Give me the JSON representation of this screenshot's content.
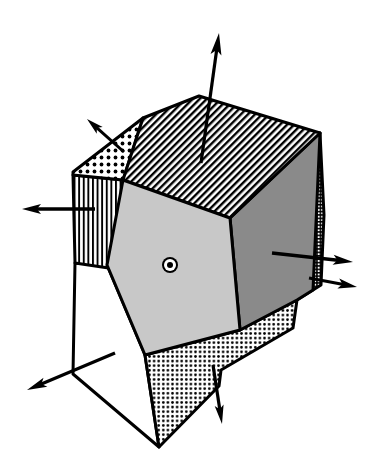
{
  "figure": {
    "type": "line-diagram",
    "background_color": "#ffffff",
    "line_color": "#000000",
    "canvas": {
      "width": 374,
      "height": 476
    }
  },
  "faces": [
    {
      "id": "top-hatched",
      "name": "top-face",
      "fill_style": "diagonal-hatch",
      "fill_color": "#ffffff",
      "pattern_color": "#000000",
      "points": "143,118 199,96 320,133 230,218 123,180"
    },
    {
      "id": "upper-left-dotted",
      "name": "upper-left-facet",
      "fill_style": "coarse-dot-grid",
      "fill_color": "#ffffff",
      "pattern_color": "#000000",
      "points": "143,118 123,180 73,175 73,172"
    },
    {
      "id": "left-striped",
      "name": "left-face",
      "fill_style": "vertical-stripes",
      "fill_color": "#ffffff",
      "pattern_color": "#000000",
      "points": "73,175 123,180 122,270 75,263"
    },
    {
      "id": "center-pentagon",
      "name": "front-face",
      "fill_style": "solid-light-gray",
      "fill_color": "#c8c8c8",
      "pattern_color": "#c8c8c8",
      "points": "123,180 230,218 240,330 145,355 107,265"
    },
    {
      "id": "right-dark",
      "name": "right-face",
      "fill_style": "solid-mid-gray",
      "fill_color": "#8a8a8a",
      "pattern_color": "#8a8a8a",
      "points": "230,218 320,133 313,290 297,300 240,330"
    },
    {
      "id": "right-sliver",
      "name": "far-right-sliver-facet",
      "fill_style": "fine-cross-hatch",
      "fill_color": "#ffffff",
      "pattern_color": "#000000",
      "points": "320,133 324,215 321,285 297,300 313,250 311,180"
    },
    {
      "id": "bottom-dotted",
      "name": "bottom-face",
      "fill_style": "fine-dot-grid",
      "fill_color": "#ffffff",
      "pattern_color": "#000000",
      "points": "145,355 240,330 297,300 293,328 221,370 219,386 159,447"
    },
    {
      "id": "lower-left-white",
      "name": "lower-left-face",
      "fill_style": "solid-white",
      "fill_color": "#ffffff",
      "pattern_color": "#ffffff",
      "points": "75,263 107,265 145,355 159,447 73,374"
    }
  ],
  "vectors": [
    {
      "id": "n-top",
      "name": "normal-top",
      "label": "",
      "tail": [
        201,
        163
      ],
      "tip": [
        219,
        33
      ],
      "length_px": 131,
      "shaft_width": 3.2,
      "head_length": 22,
      "head_width": 11
    },
    {
      "id": "n-upper-left",
      "name": "normal-upper-left",
      "label": "",
      "tail": [
        124,
        152
      ],
      "tip": [
        87,
        119
      ],
      "length_px": 50,
      "shaft_width": 3.0,
      "head_length": 17,
      "head_width": 9
    },
    {
      "id": "n-left",
      "name": "normal-left",
      "label": "",
      "tail": [
        95,
        209
      ],
      "tip": [
        22,
        209
      ],
      "length_px": 73,
      "shaft_width": 3.4,
      "head_length": 19,
      "head_width": 10
    },
    {
      "id": "n-right-upper",
      "name": "normal-right-face",
      "label": "",
      "tail": [
        272,
        253
      ],
      "tip": [
        353,
        262
      ],
      "length_px": 82,
      "shaft_width": 3.4,
      "head_length": 20,
      "head_width": 10
    },
    {
      "id": "n-right-lower",
      "name": "normal-right-sliver",
      "label": "",
      "tail": [
        309,
        278
      ],
      "tip": [
        357,
        287
      ],
      "length_px": 49,
      "shaft_width": 3.2,
      "head_length": 19,
      "head_width": 10
    },
    {
      "id": "n-bottom",
      "name": "normal-bottom",
      "label": "",
      "tail": [
        213,
        365
      ],
      "tip": [
        222,
        424
      ],
      "length_px": 60,
      "shaft_width": 3.2,
      "head_length": 19,
      "head_width": 9
    },
    {
      "id": "n-lower-left",
      "name": "normal-lower-left",
      "label": "",
      "tail": [
        115,
        353
      ],
      "tip": [
        27,
        390
      ],
      "length_px": 96,
      "shaft_width": 3.2,
      "head_length": 20,
      "head_width": 10
    }
  ],
  "symbols": [
    {
      "id": "out-of-page",
      "name": "out-of-page-vector-symbol",
      "glyph": "dot-in-circle",
      "center": [
        170,
        265
      ],
      "outer_radius": 8,
      "white_ring_radius": 6,
      "dot_radius": 3,
      "color": "#000000"
    }
  ]
}
